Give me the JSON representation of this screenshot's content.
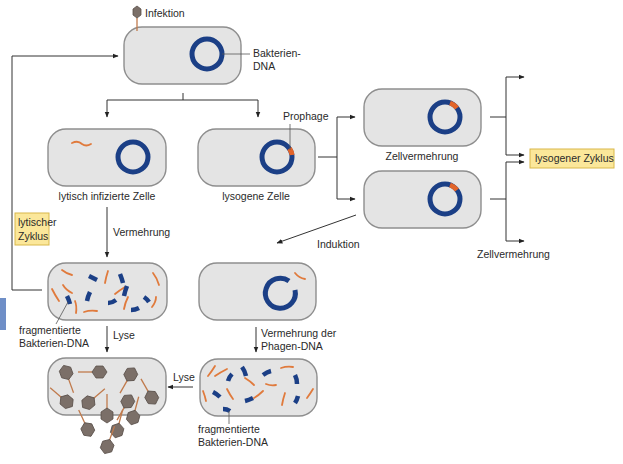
{
  "diagram": {
    "colors": {
      "cell_fill": "#e4e4e4",
      "cell_stroke": "#8e8e8e",
      "bacterial_dna": "#1b3f86",
      "prophage": "#e2642a",
      "phage_dna": "#e07a3c",
      "label_box": "#fbe79a",
      "phage_head": "#7b6f68",
      "side_tab": "#6f8fc7"
    },
    "labels": {
      "infection": "Infektion",
      "bacterial_dna_1": "Bakterien-",
      "bacterial_dna_2": "DNA",
      "prophage": "Prophage",
      "lytic_cell": "lytisch infizierte Zelle",
      "lysogenic_cell": "lysogene Zelle",
      "cell_division_top": "Zellvermehrung",
      "cell_division_bottom": "Zellvermehrung",
      "lysogenic_cycle": "lysogener Zyklus",
      "lytic_cycle_1": "lytischer",
      "lytic_cycle_2": "Zyklus",
      "replication": "Vermehrung",
      "induction": "Induktion",
      "fragmented_1a": "fragmentierte",
      "fragmented_1b": "Bakterien-DNA",
      "lysis_1": "Lyse",
      "phage_dna_rep_1": "Vermehrung der",
      "phage_dna_rep_2": "Phagen-DNA",
      "lysis_2": "Lyse",
      "fragmented_2a": "fragmentierte",
      "fragmented_2b": "Bakterien-DNA"
    },
    "nodes": [
      {
        "id": "infected-cell",
        "caption": ""
      },
      {
        "id": "lytic-infected-cell",
        "caption": "lytisch infizierte Zelle"
      },
      {
        "id": "lysogenic-cell",
        "caption": "lysogene Zelle"
      },
      {
        "id": "daughter-cell-1",
        "caption": "Zellvermehrung"
      },
      {
        "id": "daughter-cell-2",
        "caption": ""
      },
      {
        "id": "lytic-replicating-cell",
        "caption": ""
      },
      {
        "id": "induced-cell",
        "caption": ""
      },
      {
        "id": "phage-replicating-cell",
        "caption": ""
      },
      {
        "id": "lysed-cell",
        "caption": ""
      }
    ]
  }
}
